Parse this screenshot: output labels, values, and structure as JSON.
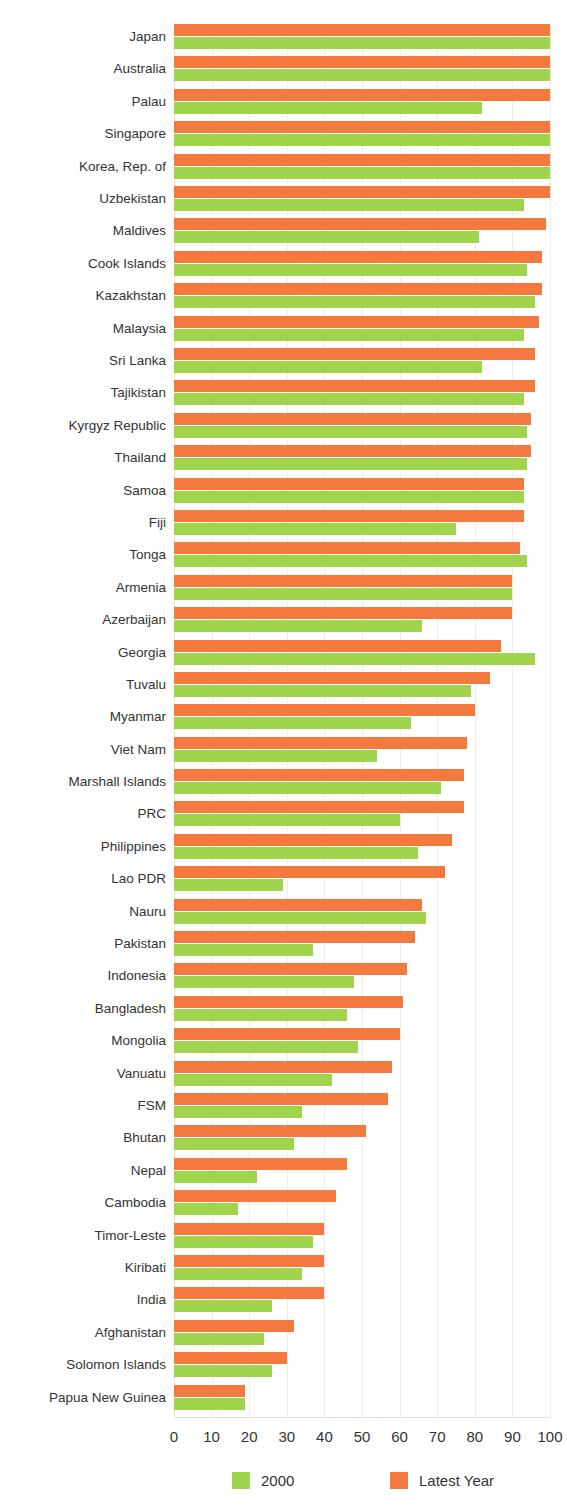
{
  "chart_data": {
    "type": "bar",
    "orientation": "horizontal",
    "title": "",
    "subtitle": "",
    "xlabel": "",
    "ylabel": "",
    "xlim": [
      0,
      100
    ],
    "xticks": [
      0,
      10,
      20,
      30,
      40,
      50,
      60,
      70,
      80,
      90,
      100
    ],
    "grid": true,
    "grid_axis": "x",
    "legend_position": "bottom",
    "colors": {
      "2000": "#9fd44c",
      "latest_year": "#f4793f",
      "gridline": "#efeede",
      "label_text": "#333333"
    },
    "categories": [
      "Japan",
      "Australia",
      "Palau",
      "Singapore",
      "Korea, Rep. of",
      "Uzbekistan",
      "Maldives",
      "Cook Islands",
      "Kazakhstan",
      "Malaysia",
      "Sri Lanka",
      "Tajikistan",
      "Kyrgyz Republic",
      "Thailand",
      "Samoa",
      "Fiji",
      "Tonga",
      "Armenia",
      "Azerbaijan",
      "Georgia",
      "Tuvalu",
      "Myanmar",
      "Viet Nam",
      "Marshall Islands",
      "PRC",
      "Philippines",
      "Lao PDR",
      "Nauru",
      "Pakistan",
      "Indonesia",
      "Bangladesh",
      "Mongolia",
      "Vanuatu",
      "FSM",
      "Bhutan",
      "Nepal",
      "Cambodia",
      "Timor-Leste",
      "Kiribati",
      "India",
      "Afghanistan",
      "Solomon Islands",
      "Papua New Guinea"
    ],
    "series": [
      {
        "name": "Latest Year",
        "color": "#f4793f",
        "values": [
          100,
          100,
          100,
          100,
          100,
          100,
          99,
          98,
          98,
          97,
          96,
          96,
          95,
          95,
          93,
          93,
          92,
          90,
          90,
          87,
          84,
          80,
          78,
          77,
          77,
          74,
          72,
          66,
          64,
          62,
          61,
          60,
          58,
          57,
          51,
          46,
          43,
          40,
          40,
          40,
          32,
          30,
          19
        ]
      },
      {
        "name": "2000",
        "color": "#9fd44c",
        "values": [
          100,
          100,
          82,
          100,
          100,
          93,
          81,
          94,
          96,
          93,
          82,
          93,
          94,
          94,
          93,
          75,
          94,
          90,
          66,
          96,
          79,
          63,
          54,
          71,
          60,
          65,
          29,
          67,
          37,
          48,
          46,
          49,
          42,
          34,
          32,
          22,
          17,
          37,
          34,
          26,
          24,
          26,
          19
        ]
      }
    ],
    "legend": [
      {
        "label": "2000",
        "color": "#9fd44c"
      },
      {
        "label": "Latest Year",
        "color": "#f4793f"
      }
    ]
  }
}
